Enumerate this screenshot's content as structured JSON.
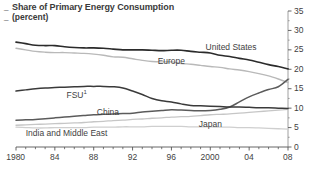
{
  "chart_data": {
    "type": "line",
    "title": "Share of Primary Energy Consumption",
    "subtitle": "(percent)",
    "xlabel": "",
    "ylabel": "",
    "xlim": [
      1980,
      2008
    ],
    "ylim": [
      0,
      35
    ],
    "ytick_labels": [
      "0",
      "5",
      "10",
      "15",
      "20",
      "25",
      "30",
      "35"
    ],
    "ytick_values": [
      0,
      5,
      10,
      15,
      20,
      25,
      30,
      35
    ],
    "yminor_step": 2.5,
    "xtick_labels": [
      "1980",
      "84",
      "88",
      "92",
      "96",
      "2000",
      "04",
      "08"
    ],
    "xtick_values": [
      1980,
      1984,
      1988,
      1992,
      1996,
      2000,
      2004,
      2008
    ],
    "xminor_step": 1,
    "grid": false,
    "legend_position": "inline-labels",
    "axis_side": "right",
    "x": [
      1980,
      1981,
      1982,
      1983,
      1984,
      1985,
      1986,
      1987,
      1988,
      1989,
      1990,
      1991,
      1992,
      1993,
      1994,
      1995,
      1996,
      1997,
      1998,
      1999,
      2000,
      2001,
      2002,
      2003,
      2004,
      2005,
      2006,
      2007,
      2008
    ],
    "series": [
      {
        "name": "United States",
        "color": "#2b2b2b",
        "width": 1.6,
        "label_x": 2003.0,
        "label_y": 25.4,
        "values": [
          27.0,
          26.6,
          26.2,
          26.1,
          26.1,
          25.8,
          25.6,
          25.5,
          25.5,
          25.4,
          25.2,
          25.0,
          25.0,
          25.0,
          24.9,
          24.8,
          24.9,
          24.9,
          24.6,
          24.4,
          24.2,
          23.6,
          23.3,
          22.8,
          22.4,
          21.8,
          21.2,
          20.7,
          20.1
        ]
      },
      {
        "name": "Europe",
        "color": "#b9b9b9",
        "width": 1.4,
        "label_x": 1996.0,
        "label_y": 22.0,
        "values": [
          25.4,
          25.0,
          24.6,
          24.4,
          24.3,
          24.3,
          24.2,
          24.1,
          23.9,
          23.6,
          23.2,
          23.1,
          22.7,
          22.3,
          22.0,
          21.9,
          21.9,
          21.5,
          21.3,
          21.0,
          20.7,
          20.5,
          20.1,
          19.8,
          19.4,
          18.9,
          18.3,
          17.5,
          16.6
        ]
      },
      {
        "name": "FSU",
        "superscript": "1",
        "color": "#3a3a3a",
        "width": 1.5,
        "label_x": 1985.2,
        "label_y": 13.3,
        "values": [
          14.4,
          14.7,
          15.0,
          15.2,
          15.3,
          15.4,
          15.5,
          15.6,
          15.6,
          15.6,
          15.5,
          15.2,
          14.4,
          13.5,
          12.5,
          11.9,
          11.6,
          11.1,
          10.7,
          10.6,
          10.5,
          10.4,
          10.3,
          10.3,
          10.2,
          10.1,
          10.1,
          10.0,
          9.9
        ]
      },
      {
        "name": "China",
        "color": "#5b5b5b",
        "width": 1.5,
        "label_x": 1989.5,
        "label_y": 8.7,
        "values": [
          6.9,
          7.0,
          7.1,
          7.3,
          7.5,
          7.7,
          7.9,
          8.1,
          8.3,
          8.4,
          8.5,
          8.6,
          8.7,
          9.0,
          9.2,
          9.4,
          9.6,
          9.5,
          9.4,
          9.3,
          9.4,
          9.7,
          10.3,
          11.6,
          12.9,
          13.9,
          14.8,
          15.5,
          17.4
        ]
      },
      {
        "name": "Japan",
        "color": "#cfcfcf",
        "width": 1.3,
        "label_x": 2000.0,
        "label_y": 5.6,
        "values": [
          5.1,
          5.0,
          4.9,
          4.9,
          5.0,
          5.0,
          5.0,
          5.0,
          5.1,
          5.1,
          5.1,
          5.2,
          5.2,
          5.2,
          5.3,
          5.3,
          5.3,
          5.3,
          5.2,
          5.2,
          5.2,
          5.1,
          5.1,
          5.0,
          5.0,
          4.9,
          4.8,
          4.7,
          4.6
        ]
      },
      {
        "name": "India and Middle East",
        "color": "#c6c6c6",
        "width": 1.3,
        "label_x": 1981.0,
        "label_y": 3.3,
        "values": [
          5.6,
          5.7,
          5.8,
          5.9,
          6.0,
          6.1,
          6.2,
          6.3,
          6.5,
          6.6,
          6.8,
          6.9,
          7.1,
          7.2,
          7.4,
          7.5,
          7.7,
          7.8,
          7.9,
          8.1,
          8.3,
          8.4,
          8.5,
          8.7,
          8.9,
          9.1,
          9.3,
          9.5,
          9.7
        ]
      }
    ]
  },
  "marks": {
    "title_dash": "_",
    "subtitle_dash": "_"
  }
}
